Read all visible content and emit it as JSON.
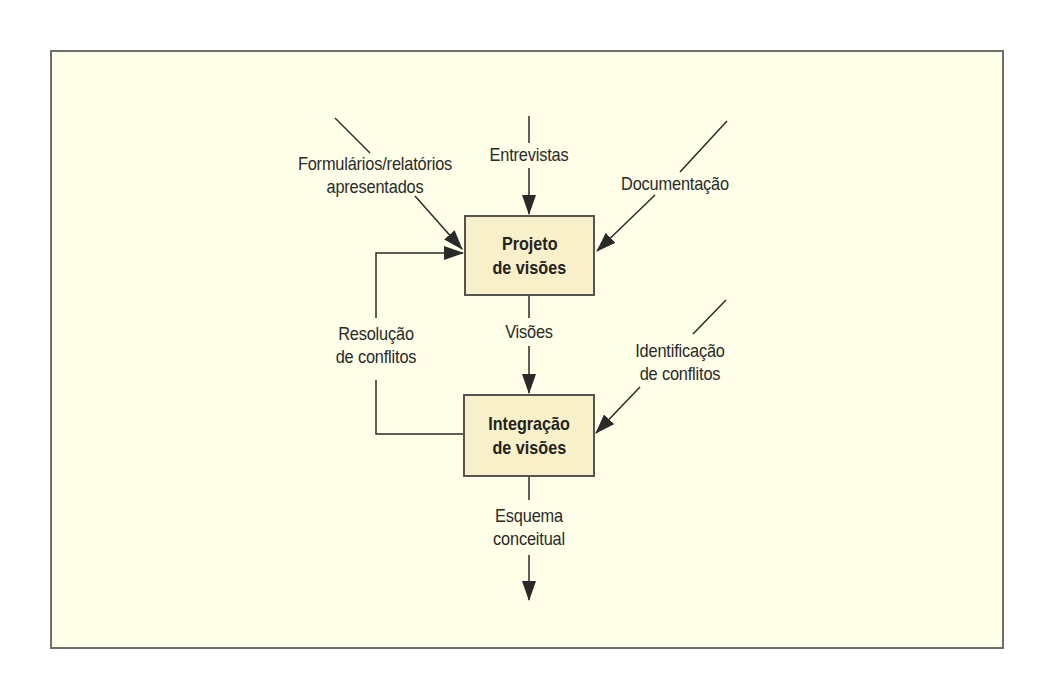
{
  "diagram": {
    "colors": {
      "background": "#fefee9",
      "box_fill": "#f7f0c8",
      "line": "#2a2a28",
      "frame": "#6f6f6a"
    },
    "boxes": {
      "view_design": {
        "line1": "Projeto",
        "line2": "de visões"
      },
      "view_integration": {
        "line1": "Integração",
        "line2": "de visões"
      }
    },
    "inputs": {
      "forms": {
        "line1": "Formulários/relatórios",
        "line2": "apresentados"
      },
      "interviews": {
        "line1": "Entrevistas"
      },
      "documentation": {
        "line1": "Documentação"
      },
      "conflict_identification": {
        "line1": "Identificação",
        "line2": "de conflitos"
      }
    },
    "flows": {
      "views": {
        "line1": "Visões"
      },
      "conflict_resolution": {
        "line1": "Resolução",
        "line2": "de conflitos"
      },
      "output": {
        "line1": "Esquema",
        "line2": "conceitual"
      }
    }
  }
}
